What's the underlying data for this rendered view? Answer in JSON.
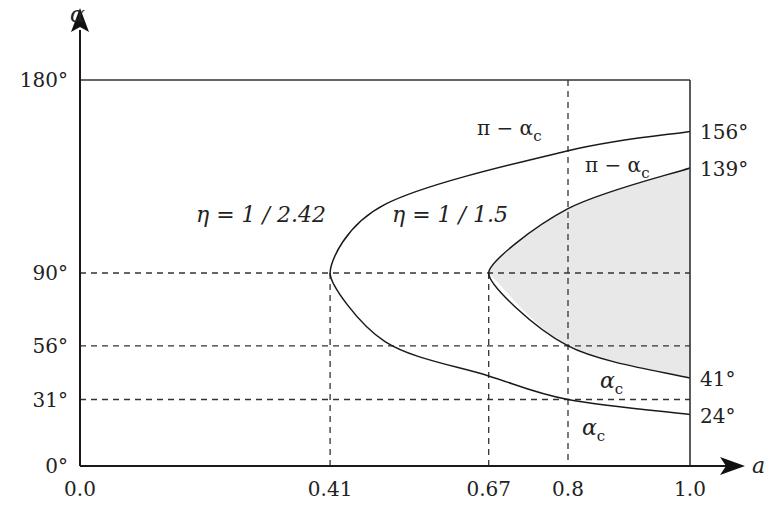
{
  "chart_data": {
    "type": "line",
    "title": "",
    "xlabel": "a",
    "ylabel": "α",
    "xlim": [
      0.0,
      1.0
    ],
    "ylim": [
      0,
      180
    ],
    "grid": false,
    "x_ticks": [
      "0.0",
      "0.41",
      "0.67",
      "0.8",
      "1.0"
    ],
    "y_ticks_left": [
      "0°",
      "31°",
      "56°",
      "90°",
      "180°"
    ],
    "y_ticks_right": [
      "156°",
      "139°",
      "41°",
      "24°"
    ],
    "x_tick_values": [
      0.0,
      0.41,
      0.67,
      0.8,
      1.0
    ],
    "y_tick_left_values": [
      0,
      31,
      56,
      90,
      180
    ],
    "y_tick_right_values": [
      156,
      139,
      41,
      24
    ],
    "reference_lines": {
      "horizontal": [
        90,
        56,
        31
      ],
      "vertical": [
        0.41,
        0.67,
        0.8
      ]
    },
    "series": [
      {
        "name": "η = 1 / 2.42",
        "vertex_a": 0.41,
        "upper_label": "π − αc",
        "lower_label": "αc",
        "points_upper": [
          [
            0.41,
            90
          ],
          [
            0.5,
            122
          ],
          [
            0.8,
            147
          ],
          [
            1.0,
            156
          ]
        ],
        "points_lower": [
          [
            0.41,
            90
          ],
          [
            0.5,
            58
          ],
          [
            0.67,
            42
          ],
          [
            0.8,
            31
          ],
          [
            1.0,
            24
          ]
        ]
      },
      {
        "name": "η = 1 / 1.5",
        "vertex_a": 0.67,
        "shaded": true,
        "shade_color": "#e8e8e8",
        "upper_label": "π − αc",
        "lower_label": "αc",
        "points_upper": [
          [
            0.67,
            90
          ],
          [
            0.8,
            120
          ],
          [
            1.0,
            139
          ]
        ],
        "points_lower": [
          [
            0.67,
            90
          ],
          [
            0.8,
            56
          ],
          [
            1.0,
            41
          ]
        ]
      }
    ],
    "annotations": {
      "eta1": "η = 1 / 2.42",
      "eta2": "η = 1 / 1.5",
      "pi_minus_ac": "π − α",
      "ac": "α",
      "sub_c": "c"
    }
  }
}
